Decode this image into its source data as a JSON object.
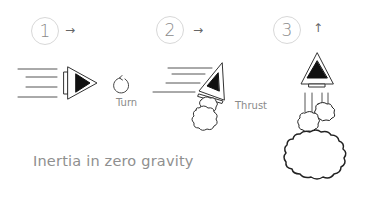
{
  "title": "Inertia in zero gravity",
  "steps": [
    {
      "number": "1",
      "direction": "→",
      "action": "Turn"
    },
    {
      "number": "2",
      "direction": "→",
      "action": "Thrust"
    },
    {
      "number": "3",
      "direction": "↑",
      "action": ""
    }
  ],
  "colors": {
    "stroke": "#222222",
    "badge_border": "#d8d8d8",
    "text": "#8a8a8a",
    "background": "#ffffff"
  }
}
